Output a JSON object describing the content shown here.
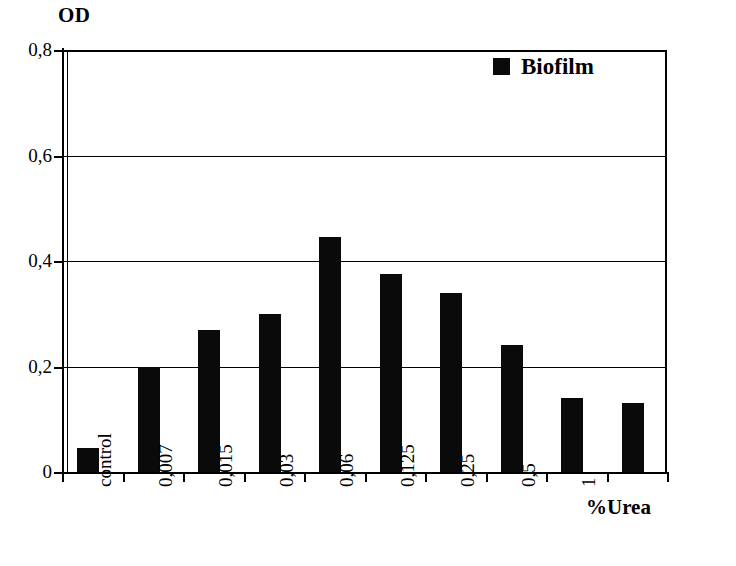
{
  "chart_data": {
    "type": "bar",
    "title": "",
    "xlabel": "%Urea",
    "ylabel": "OD",
    "ylim": [
      0,
      0.8
    ],
    "yticks": [
      0,
      0.2,
      0.4,
      0.6,
      0.8
    ],
    "ytick_labels": [
      "0",
      "0,2",
      "0,4",
      "0,6",
      "0,8"
    ],
    "grid": true,
    "legend_position": "top-right",
    "decimal_separator": ",",
    "categories": [
      "control",
      "0,007",
      "0,015",
      "0,03",
      "0,06",
      "0,125",
      "0,25",
      "0,5",
      "1",
      ""
    ],
    "series": [
      {
        "name": "Biofilm",
        "color": "#0a0a0a",
        "values": [
          0.045,
          0.2,
          0.27,
          0.3,
          0.445,
          0.375,
          0.34,
          0.24,
          0.14,
          0.13
        ]
      }
    ]
  },
  "legend": {
    "swatch_color": "#0a0a0a",
    "label": "Biofilm"
  },
  "axes": {
    "y_title": "OD",
    "x_title": "%Urea"
  }
}
